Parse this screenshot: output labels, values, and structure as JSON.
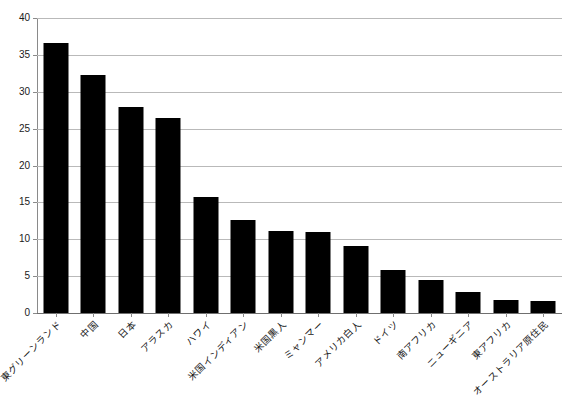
{
  "chart_data": {
    "type": "bar",
    "title": "",
    "subtitle": "",
    "xlabel": "",
    "ylabel": "",
    "ylim": [
      0,
      40
    ],
    "y_ticks": [
      0,
      5,
      10,
      15,
      20,
      25,
      30,
      35,
      40
    ],
    "grid": true,
    "legend": false,
    "legend_position": "none",
    "orientation": "vertical",
    "bar_color": "#000000",
    "gridline_color": "#b9b9b9",
    "axis_color": "#8a8a8a",
    "categories": [
      "東グリーンランド",
      "中国",
      "日本",
      "アラスカ",
      "ハワイ",
      "米国インディアン",
      "米国黒人",
      "ミャンマー",
      "アメリカ白人",
      "ドイツ",
      "南アフリカ",
      "ニューギニア",
      "東アフリカ",
      "オーストラリア原住民"
    ],
    "values": [
      36.6,
      32.3,
      28.0,
      26.5,
      15.7,
      12.6,
      11.1,
      11.0,
      9.1,
      5.9,
      4.5,
      2.9,
      1.7,
      1.6
    ]
  },
  "axis": {
    "y_tick_labels": [
      "0",
      "5",
      "10",
      "15",
      "20",
      "25",
      "30",
      "35",
      "40"
    ]
  }
}
